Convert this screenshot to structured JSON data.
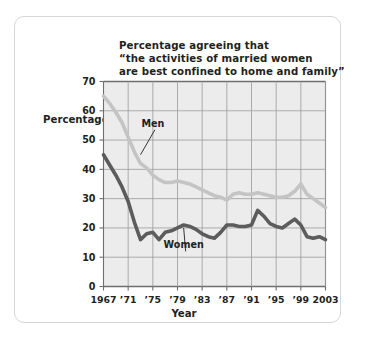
{
  "card": {
    "border_color": "#d6d6d6"
  },
  "chart_data": {
    "type": "line",
    "title": "Percentage agreeing that\n“the activities of married women\nare best confined to home and family”",
    "xlabel": "Year",
    "ylabel": "Percentage",
    "ylim": [
      0,
      70
    ],
    "xlim": [
      1967,
      2003
    ],
    "grid": true,
    "legend_position": "inline-annotation",
    "plot_background": "#ececec",
    "grid_color": "#9b9b9b",
    "axis_color": "#6e6e6e",
    "yticks": [
      0,
      10,
      20,
      30,
      40,
      50,
      60,
      70
    ],
    "ytick_labels": [
      "0",
      "10",
      "20",
      "30",
      "40",
      "50",
      "60",
      "70"
    ],
    "xticks": [
      1967,
      1971,
      1975,
      1979,
      1983,
      1987,
      1991,
      1995,
      1999,
      2003
    ],
    "xtick_labels": [
      "1967",
      "’71",
      "’75",
      "’79",
      "’83",
      "’87",
      "’91",
      "’95",
      "’99",
      "2003"
    ],
    "series": [
      {
        "name": "Men",
        "color": "#c4c4c4",
        "label_position": {
          "x": 1975.0,
          "y": 54.5
        },
        "leader_to": {
          "x": 1973.0,
          "y": 45.0
        },
        "x": [
          1967,
          1968,
          1969,
          1970,
          1971,
          1972,
          1973,
          1974,
          1975,
          1976,
          1977,
          1978,
          1979,
          1980,
          1981,
          1982,
          1983,
          1984,
          1985,
          1986,
          1987,
          1988,
          1989,
          1990,
          1991,
          1992,
          1993,
          1994,
          1995,
          1996,
          1997,
          1998,
          1999,
          2000,
          2001,
          2002,
          2003
        ],
        "values": [
          65,
          62.5,
          59.5,
          56,
          51,
          46,
          42,
          40.5,
          38,
          36.5,
          35.5,
          35.5,
          36,
          35.5,
          35,
          34,
          33,
          32,
          31,
          30.5,
          29.5,
          31.5,
          32,
          31.5,
          31.5,
          32,
          31.5,
          31,
          30.5,
          30.5,
          31,
          32.5,
          35,
          31.5,
          30,
          28.5,
          27
        ]
      },
      {
        "name": "Women",
        "color": "#5c5c5c",
        "label_position": {
          "x": 1980.0,
          "y": 13.0
        },
        "leader_to": {
          "x": 1980.0,
          "y": 20.0
        },
        "x": [
          1967,
          1968,
          1969,
          1970,
          1971,
          1972,
          1973,
          1974,
          1975,
          1976,
          1977,
          1978,
          1979,
          1980,
          1981,
          1982,
          1983,
          1984,
          1985,
          1986,
          1987,
          1988,
          1989,
          1990,
          1991,
          1992,
          1993,
          1994,
          1995,
          1996,
          1997,
          1998,
          1999,
          2000,
          2001,
          2002,
          2003
        ],
        "values": [
          45,
          41.5,
          38,
          34,
          29,
          22,
          16,
          18,
          18.5,
          16,
          18.5,
          19,
          20,
          21,
          20.5,
          19.5,
          18,
          17,
          16.5,
          18.5,
          21,
          21,
          20.5,
          20.5,
          21,
          26,
          24,
          21.5,
          20.5,
          20,
          21.5,
          23,
          21,
          17,
          16.5,
          17,
          16
        ]
      }
    ],
    "annotations": [
      {
        "text": "Men",
        "kind": "series-callout"
      },
      {
        "text": "Women",
        "kind": "series-callout"
      }
    ]
  }
}
